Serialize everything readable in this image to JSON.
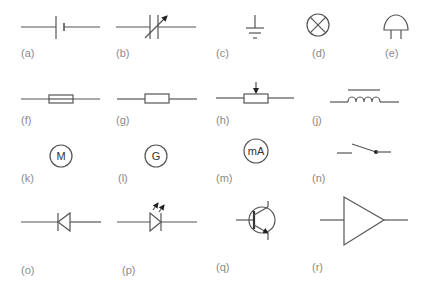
{
  "figure": {
    "line_color": "#555555",
    "label_color": "#8a8a8a",
    "symbols": [
      {
        "id": "a",
        "label": "(a)",
        "name": "battery-cell"
      },
      {
        "id": "b",
        "label": "(b)",
        "name": "variable-capacitor"
      },
      {
        "id": "c",
        "label": "(c)",
        "name": "earth-ground"
      },
      {
        "id": "d",
        "label": "(d)",
        "name": "lamp"
      },
      {
        "id": "e",
        "label": "(e)",
        "name": "buzzer"
      },
      {
        "id": "f",
        "label": "(f)",
        "name": "fuse"
      },
      {
        "id": "g",
        "label": "(g)",
        "name": "resistor"
      },
      {
        "id": "h",
        "label": "(h)",
        "name": "variable-resistor-potentiometer"
      },
      {
        "id": "j",
        "label": "(j)",
        "name": "inductor-iron-core"
      },
      {
        "id": "k",
        "label": "(k)",
        "name": "motor",
        "text": "M"
      },
      {
        "id": "l",
        "label": "(l)",
        "name": "generator",
        "text": "G"
      },
      {
        "id": "m",
        "label": "(m)",
        "name": "milliammeter",
        "text": "mA"
      },
      {
        "id": "n",
        "label": "(n)",
        "name": "switch-open"
      },
      {
        "id": "o",
        "label": "(o)",
        "name": "diode"
      },
      {
        "id": "p",
        "label": "(p)",
        "name": "light-emitting-diode"
      },
      {
        "id": "q",
        "label": "(q)",
        "name": "npn-transistor"
      },
      {
        "id": "r",
        "label": "(r)",
        "name": "amplifier"
      }
    ]
  }
}
